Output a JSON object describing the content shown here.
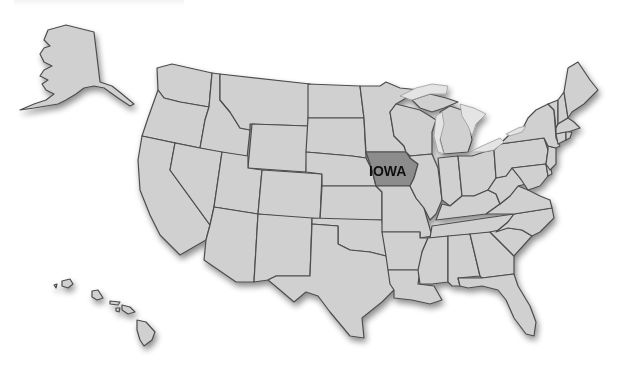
{
  "map": {
    "title": "United States map highlighting Iowa",
    "highlighted_state": {
      "name": "Iowa",
      "label": "IOWA",
      "fill": "#8c8c8c"
    },
    "colors": {
      "background": "#ffffff",
      "state_fill": "#d0d0d0",
      "state_border": "#4d4d4d",
      "lake_fill": "#e4e4e4",
      "label_color": "#111111"
    },
    "insets": [
      "Alaska",
      "Hawaii"
    ]
  }
}
